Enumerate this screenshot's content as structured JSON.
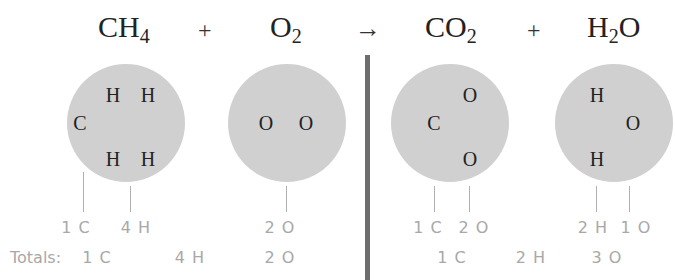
{
  "equation": {
    "reactants": [
      {
        "id": "ch4",
        "base": "CH",
        "sub": "4",
        "tail": ""
      },
      {
        "id": "o2",
        "base": "O",
        "sub": "2",
        "tail": ""
      }
    ],
    "products": [
      {
        "id": "co2",
        "base": "CO",
        "sub": "2",
        "tail": ""
      },
      {
        "id": "h2o",
        "base": "H",
        "sub": "2",
        "tail": "O"
      }
    ],
    "plus": "+",
    "arrow": "→"
  },
  "molecules": {
    "ch4": {
      "atoms": [
        "H",
        "H",
        "C",
        "H",
        "H"
      ],
      "counts": [
        "1 C",
        "4 H"
      ]
    },
    "o2": {
      "atoms": [
        "O",
        "O"
      ],
      "counts": [
        "2 O"
      ]
    },
    "co2": {
      "atoms": [
        "O",
        "C",
        "O"
      ],
      "counts": [
        "1 C",
        "2 O"
      ]
    },
    "h2o": {
      "atoms": [
        "H",
        "O",
        "H"
      ],
      "counts": [
        "2 H",
        "1 O"
      ]
    }
  },
  "totals": {
    "label": "Totals:",
    "reactants": [
      "1 C",
      "4 H",
      "2 O"
    ],
    "products": [
      "1 C",
      "2 H",
      "3 O"
    ]
  },
  "colors": {
    "circle": "#d0d0d0",
    "divider": "#6e6e6e",
    "count_text": "#a8a8a8"
  }
}
